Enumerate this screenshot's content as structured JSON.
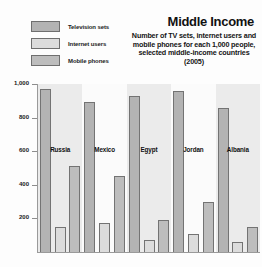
{
  "header": {
    "title": "Middle Income",
    "subtitle": "Number of TV sets, internet users and mobile phones for each 1,000 people, selected middle-income countries (2005)"
  },
  "legend": {
    "position": "top-left",
    "items": [
      {
        "label": "Television sets",
        "color": "#b3b3b3"
      },
      {
        "label": "Internet users",
        "color": "#dcdcdc"
      },
      {
        "label": "Mobile phones",
        "color": "#bdbdbd"
      }
    ]
  },
  "axis": {
    "ticks": [
      {
        "label": "1,000",
        "value": 1000
      },
      {
        "label": "800",
        "value": 800
      },
      {
        "label": "600",
        "value": 600
      },
      {
        "label": "400",
        "value": 400
      },
      {
        "label": "200",
        "value": 200
      }
    ]
  },
  "chart_data": {
    "type": "bar",
    "title": "Middle Income",
    "subtitle": "Number of TV sets, internet users and mobile phones for each 1,000 people, selected middle-income countries (2005)",
    "xlabel": "",
    "ylabel": "",
    "ylim": [
      0,
      1000
    ],
    "grid": false,
    "legend_position": "top-left",
    "categories": [
      "Russia",
      "Mexico",
      "Egypt",
      "Jordan",
      "Albania"
    ],
    "series": [
      {
        "name": "Television sets",
        "color": "#b3b3b3",
        "values": [
          970,
          890,
          930,
          960,
          860
        ]
      },
      {
        "name": "Internet users",
        "color": "#dcdcdc",
        "values": [
          150,
          170,
          70,
          110,
          60
        ]
      },
      {
        "name": "Mobile phones",
        "color": "#bdbdbd",
        "values": [
          510,
          450,
          190,
          300,
          150
        ]
      }
    ]
  }
}
